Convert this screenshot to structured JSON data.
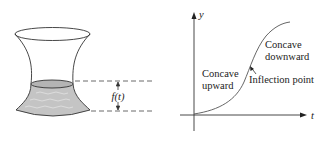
{
  "vase_figure": {
    "height_label": "f(t)",
    "water_fill_color": "#c4c4c4",
    "line_color": "#333333"
  },
  "graph": {
    "y_axis_label": "y",
    "x_axis_label": "t",
    "annotations": {
      "concave_up_line1": "Concave",
      "concave_up_line2": "upward",
      "concave_down_line1": "Concave",
      "concave_down_line2": "downward",
      "inflection": "Inflection point"
    },
    "curve_color": "#555555"
  }
}
